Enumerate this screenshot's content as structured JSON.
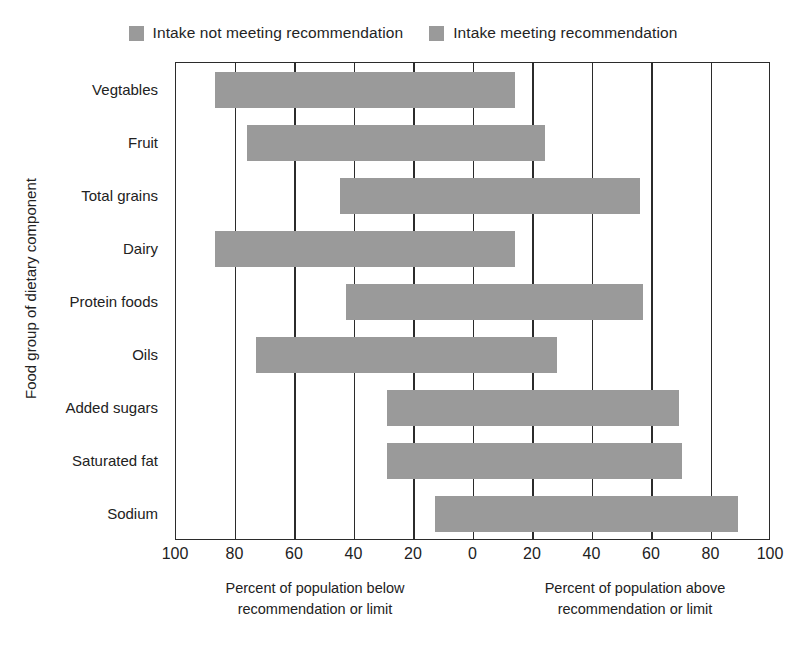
{
  "legend": {
    "items": [
      {
        "label": "Intake not meeting recommendation",
        "color": "#9a9a9a",
        "icon": "legend-swatch-icon"
      },
      {
        "label": "Intake meeting recommendation",
        "color": "#9a9a9a",
        "icon": "legend-swatch-icon"
      }
    ]
  },
  "axes": {
    "ylabel": "Food group of dietary component",
    "xlabel_left_line1": "Percent of population below",
    "xlabel_left_line2": "recommendation or limit",
    "xlabel_right_line1": "Percent of population above",
    "xlabel_right_line2": "recommendation or limit"
  },
  "chart_data": {
    "type": "bar",
    "orientation": "horizontal",
    "title": "",
    "xlabel": "Percent of population below recommendation or limit / Percent of population above recommendation or limit",
    "ylabel": "Food group of dietary component",
    "xlim": [
      -100,
      100
    ],
    "xticks": [
      -100,
      -80,
      -60,
      -40,
      -20,
      0,
      20,
      40,
      60,
      80,
      100
    ],
    "xticklabels": [
      "100",
      "80",
      "60",
      "40",
      "20",
      "0",
      "20",
      "40",
      "60",
      "80",
      "100"
    ],
    "grid": true,
    "legend_position": "top-center",
    "bar_color": "#9a9a9a",
    "categories": [
      "Vegtables",
      "Fruit",
      "Total grains",
      "Dairy",
      "Protein foods",
      "Oils",
      "Added sugars",
      "Saturated fat",
      "Sodium"
    ],
    "series": [
      {
        "name": "Intake not meeting recommendation",
        "description": "Percent of population below recommendation or limit (plotted left of zero)",
        "values": [
          87,
          76,
          45,
          87,
          43,
          73,
          0,
          0,
          0
        ]
      },
      {
        "name": "Intake meeting recommendation",
        "description": "Percent of population above recommendation or limit (plotted right of zero)",
        "values": [
          14,
          24,
          56,
          14,
          57,
          28,
          0,
          0,
          0
        ]
      }
    ],
    "bars": [
      {
        "category": "Vegtables",
        "left": 87,
        "right": 14
      },
      {
        "category": "Fruit",
        "left": 76,
        "right": 24
      },
      {
        "category": "Total grains",
        "left": 45,
        "right": 56
      },
      {
        "category": "Dairy",
        "left": 87,
        "right": 14
      },
      {
        "category": "Protein foods",
        "left": 43,
        "right": 57
      },
      {
        "category": "Oils",
        "left": 73,
        "right": 28
      },
      {
        "category": "Added sugars",
        "left": 29,
        "right": 69
      },
      {
        "category": "Saturated fat",
        "left": 29,
        "right": 70
      },
      {
        "category": "Sodium",
        "left": 13,
        "right": 89
      }
    ]
  }
}
